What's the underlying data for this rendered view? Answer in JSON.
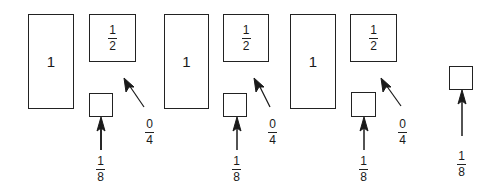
{
  "diagram": {
    "colors": {
      "stroke": "#222222",
      "background": "#ffffff"
    },
    "groups": [
      {
        "whole_box": {
          "label": "1",
          "x": 28,
          "y": 14,
          "w": 46,
          "h": 95
        },
        "half_box": {
          "numerator": "1",
          "denominator": "2",
          "x": 89,
          "y": 14,
          "w": 47,
          "h": 48
        },
        "small_box": {
          "x": 89,
          "y": 93,
          "w": 24,
          "h": 24
        },
        "small_arrow_label": {
          "numerator": "1",
          "denominator": "8",
          "x": 101,
          "y": 155
        },
        "small_arrow": {
          "x1": 101,
          "y1": 150,
          "x2": 101,
          "y2": 118
        },
        "diag_arrow": {
          "x1": 144,
          "y1": 107,
          "x2": 124,
          "y2": 78
        },
        "diag_label": {
          "numerator": "0",
          "denominator": "4",
          "x": 150,
          "y": 118
        }
      },
      {
        "whole_box": {
          "label": "1",
          "x": 164,
          "y": 14,
          "w": 45,
          "h": 95
        },
        "half_box": {
          "numerator": "1",
          "denominator": "2",
          "x": 223,
          "y": 14,
          "w": 46,
          "h": 48
        },
        "small_box": {
          "x": 223,
          "y": 93,
          "w": 24,
          "h": 24
        },
        "small_arrow_label": {
          "numerator": "1",
          "denominator": "8",
          "x": 237,
          "y": 155
        },
        "small_arrow": {
          "x1": 237,
          "y1": 150,
          "x2": 237,
          "y2": 118
        },
        "diag_arrow": {
          "x1": 270,
          "y1": 107,
          "x2": 254,
          "y2": 78
        },
        "diag_label": {
          "numerator": "0",
          "denominator": "4",
          "x": 273,
          "y": 118
        }
      },
      {
        "whole_box": {
          "label": "1",
          "x": 290,
          "y": 14,
          "w": 46,
          "h": 95
        },
        "half_box": {
          "numerator": "1",
          "denominator": "2",
          "x": 350,
          "y": 14,
          "w": 47,
          "h": 48
        },
        "small_box": {
          "x": 351,
          "y": 92,
          "w": 25,
          "h": 25
        },
        "small_arrow_label": {
          "numerator": "1",
          "denominator": "8",
          "x": 364,
          "y": 155
        },
        "small_arrow": {
          "x1": 364,
          "y1": 150,
          "x2": 364,
          "y2": 118
        },
        "diag_arrow": {
          "x1": 401,
          "y1": 106,
          "x2": 381,
          "y2": 78
        },
        "diag_label": {
          "numerator": "0",
          "denominator": "4",
          "x": 403,
          "y": 118
        }
      },
      {
        "small_box": {
          "x": 449,
          "y": 66,
          "w": 24,
          "h": 24
        },
        "small_arrow_label": {
          "numerator": "1",
          "denominator": "8",
          "x": 462,
          "y": 150
        },
        "small_arrow": {
          "x1": 462,
          "y1": 136,
          "x2": 462,
          "y2": 91
        }
      }
    ]
  }
}
